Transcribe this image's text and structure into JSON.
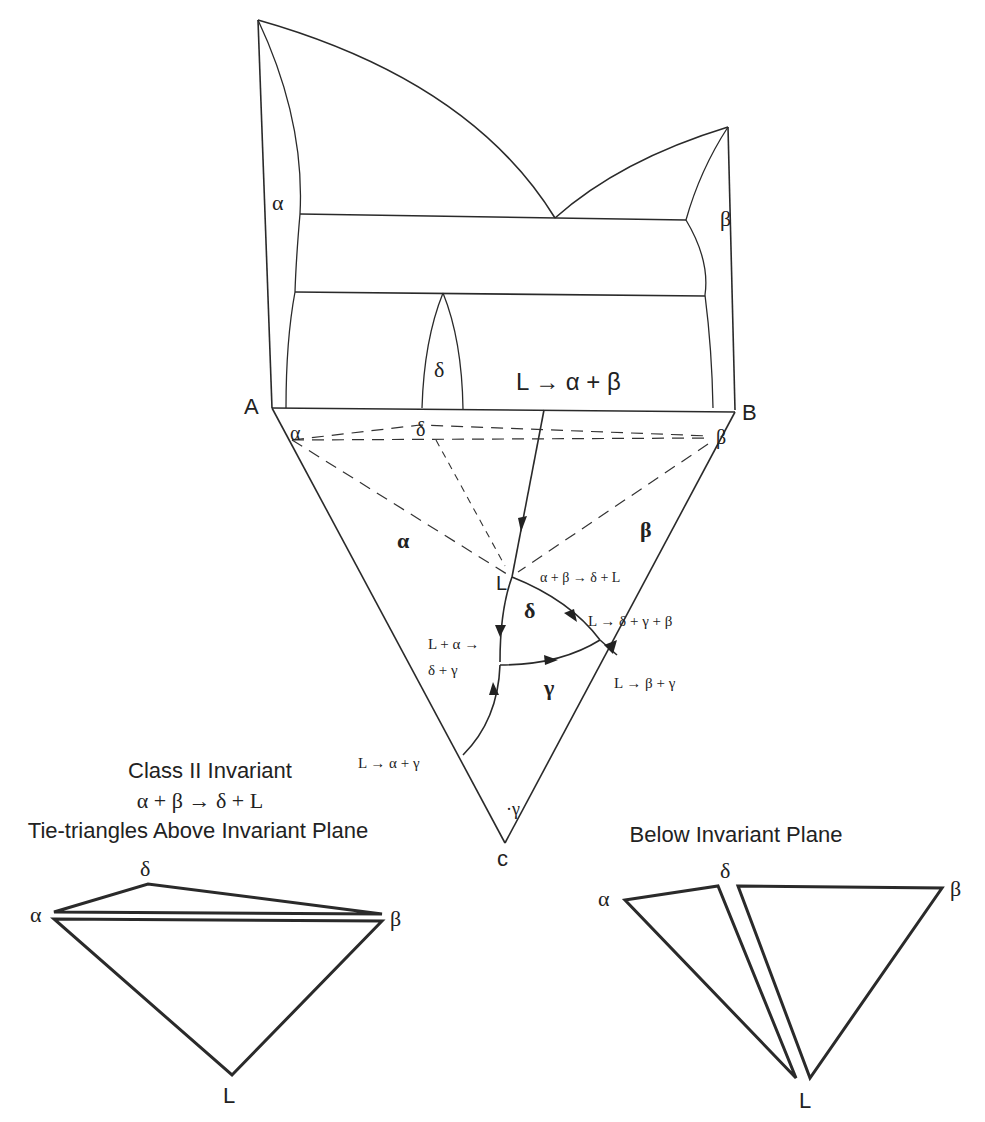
{
  "figure": {
    "title_lines": [
      "Class II Invariant",
      "α + β → δ + L",
      "Tie-triangles Above Invariant Plane"
    ],
    "below_title": "Below Invariant Plane"
  },
  "binary_AB": {
    "corner_A": "A",
    "corner_B": "B",
    "phase_alpha": "α",
    "phase_beta": "β",
    "phase_delta": "δ",
    "reaction": "L → α + β"
  },
  "ternary": {
    "corner_C": "c",
    "tie_alpha": "α",
    "tie_delta": "δ",
    "tie_beta": "β",
    "region_alpha": "α",
    "region_beta": "β",
    "region_delta": "δ",
    "region_gamma": "γ",
    "corner_gamma": "·γ",
    "point_L": "L",
    "reactions": {
      "class2": "α + β → δ + L",
      "peritectic_like": "L + α →",
      "peritectic_like_2": "δ + γ",
      "ternary_eutectic": "L → δ + γ + β",
      "l_beta_gamma": "L → β + γ",
      "l_alpha_gamma": "L → α + γ"
    }
  },
  "above_triangles": {
    "alpha": "α",
    "delta": "δ",
    "beta": "β",
    "L": "L"
  },
  "below_triangles": {
    "alpha": "α",
    "delta": "δ",
    "beta": "β",
    "L": "L"
  }
}
